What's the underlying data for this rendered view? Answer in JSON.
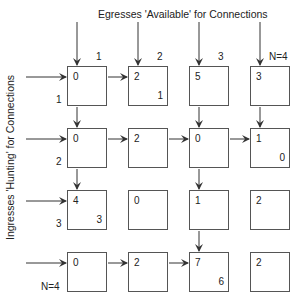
{
  "titles": {
    "egress": "Egresses 'Available' for Connections",
    "ingress": "Ingresses 'Hunting' for Connections"
  },
  "column_labels": [
    "1",
    "2",
    "3",
    "N=4"
  ],
  "row_labels": [
    "1",
    "2",
    "3",
    "N=4"
  ],
  "grid": {
    "rows": [
      [
        {
          "v": "0"
        },
        {
          "v": "2",
          "next": "1"
        },
        {
          "v": "5"
        },
        {
          "v": "3"
        }
      ],
      [
        {
          "v": "0"
        },
        {
          "v": "2"
        },
        {
          "v": "0"
        },
        {
          "v": "1",
          "next": "0"
        }
      ],
      [
        {
          "v": "4",
          "next": "3"
        },
        {
          "v": "0"
        },
        {
          "v": "1"
        },
        {
          "v": "2"
        }
      ],
      [
        {
          "v": "0"
        },
        {
          "v": "2"
        },
        {
          "v": "7",
          "next": "6"
        },
        {
          "v": "2"
        }
      ]
    ]
  },
  "cells": {
    "r0c0": "0",
    "r0c1": "2",
    "r0c1_next": "1",
    "r0c2": "5",
    "r0c3": "3",
    "r1c0": "0",
    "r1c1": "2",
    "r1c2": "0",
    "r1c3": "1",
    "r1c3_next": "0",
    "r2c0": "4",
    "r2c0_next": "3",
    "r2c1": "0",
    "r2c2": "1",
    "r2c3": "2",
    "r3c0": "0",
    "r3c1": "2",
    "r3c2": "7",
    "r3c2_next": "6",
    "r3c3": "2"
  },
  "colors": {
    "line": "#333333",
    "box": "#555555",
    "text": "#222222"
  }
}
